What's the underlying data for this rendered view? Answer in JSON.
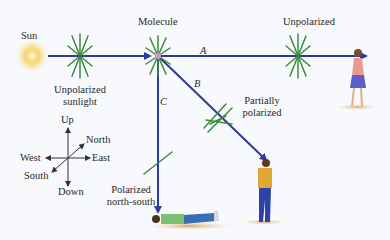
{
  "labels": {
    "sun": "Sun",
    "molecule": "Molecule",
    "unpolarized_right": "Unpolarized",
    "unpolarized_sunlight_line1": "Unpolarized",
    "unpolarized_sunlight_line2": "sunlight",
    "partially_line1": "Partially",
    "partially_line2": "polarized",
    "polarized_ns_line1": "Polarized",
    "polarized_ns_line2": "north-south",
    "ray_a": "A",
    "ray_b": "B",
    "ray_c": "C"
  },
  "compass": {
    "up": "Up",
    "down": "Down",
    "north": "North",
    "south": "South",
    "east": "East",
    "west": "West"
  },
  "colors": {
    "ray": "#2e3a9e",
    "field": "#3c8a3c",
    "sun": "#f2c232",
    "molecule": "#d98fd0",
    "background": "#f7f9fc"
  },
  "icons": [
    "sun-icon",
    "molecule-icon",
    "woman-figure-icon",
    "standing-man-icon",
    "lying-man-icon",
    "compass-icon"
  ]
}
